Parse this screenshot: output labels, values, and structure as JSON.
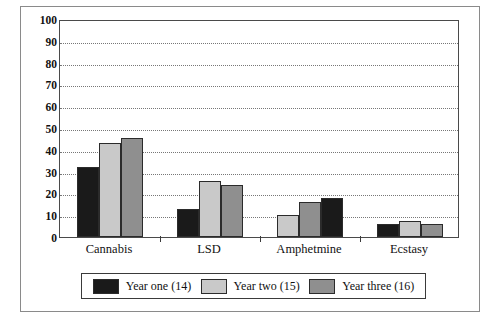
{
  "chart_data": {
    "type": "bar",
    "title": "",
    "xlabel": "",
    "ylabel": "",
    "ylim": [
      0,
      100
    ],
    "ytick_step": 10,
    "yticks": [
      100,
      90,
      80,
      70,
      60,
      50,
      40,
      30,
      20,
      10,
      0
    ],
    "grid": true,
    "legend_position": "bottom",
    "categories": [
      "Cannabis",
      "LSD",
      "Amphetmine",
      "Ecstasy"
    ],
    "series": [
      {
        "name": "Year one (14)",
        "color": "#1a1a1a",
        "values": [
          32,
          13,
          18,
          6
        ]
      },
      {
        "name": "Year two (15)",
        "color": "#c9c9c9",
        "values": [
          43,
          25.5,
          10,
          7.5
        ]
      },
      {
        "name": "Year three (16)",
        "color": "#8f8f8f",
        "values": [
          45.5,
          24,
          16,
          6
        ]
      }
    ],
    "group_bar_order": [
      [
        "Year one (14)",
        "Year two (15)",
        "Year three (16)"
      ],
      [
        "Year one (14)",
        "Year two (15)",
        "Year three (16)"
      ],
      [
        "Year two (15)",
        "Year three (16)",
        "Year one (14)"
      ],
      [
        "Year one (14)",
        "Year two (15)",
        "Year three (16)"
      ]
    ],
    "group_separator_ticks": 3
  },
  "legend": {
    "items": [
      {
        "label": "Year one (14)",
        "color": "#1a1a1a"
      },
      {
        "label": "Year two (15)",
        "color": "#c9c9c9"
      },
      {
        "label": "Year three (16)",
        "color": "#8f8f8f"
      }
    ]
  },
  "colors": {
    "year_one": "#1a1a1a",
    "year_two": "#c9c9c9",
    "year_three": "#8f8f8f",
    "plot_border": "#4a4a4a",
    "gridline": "#777777",
    "figure_border": "#8a8a8a",
    "text": "#111111"
  }
}
